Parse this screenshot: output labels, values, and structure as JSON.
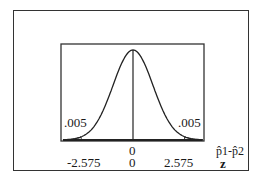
{
  "chart_data": {
    "type": "line",
    "title": "",
    "xlabel": "z",
    "x_secondary_label": "p̂1-p̂2",
    "x_ticks_primary": [
      "-2.575",
      "0",
      "2.575"
    ],
    "x_ticks_secondary": [
      "0"
    ],
    "tail_areas": [
      {
        "side": "left",
        "area": ".005",
        "boundary": "-2.575"
      },
      {
        "side": "right",
        "area": ".005",
        "boundary": "2.575"
      }
    ],
    "xlim": [
      -3.5,
      3.5
    ],
    "grid": false
  },
  "labels": {
    "left_tail": ".005",
    "right_tail": ".005",
    "center_phat": "0",
    "z_left": "-2.575",
    "z_center": "0",
    "z_right": "2.575",
    "phat_axis": "p̂1-p̂2",
    "z_axis": "z"
  }
}
